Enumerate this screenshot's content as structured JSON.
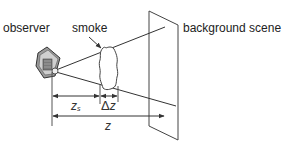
{
  "diagram": {
    "labels": {
      "observer": "observer",
      "smoke": "smoke",
      "background_scene": "background scene"
    },
    "dimensions": {
      "z_s_base": "z",
      "z_s_sub": "s",
      "delta_symbol": "Δ",
      "delta_var": "z",
      "z_total": "z"
    },
    "icons": {
      "observer": "camera-icon",
      "smoke": "cloud-icon",
      "background": "screen-plane"
    },
    "colors": {
      "stroke": "#333333",
      "text": "#222222",
      "background": "#ffffff"
    }
  }
}
